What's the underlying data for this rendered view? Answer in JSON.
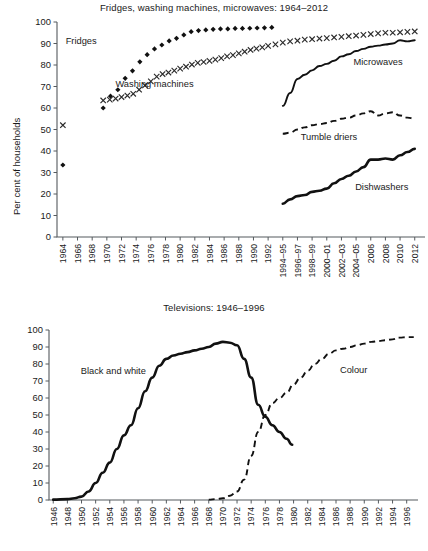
{
  "chart_data": [
    {
      "type": "line",
      "title": "Fridges, washing machines, microwaves: 1964–2012",
      "xlabel": "",
      "ylabel": "Per cent of households",
      "ylim": [
        0,
        100
      ],
      "ytick_labels": [
        "0",
        "10",
        "20",
        "30",
        "40",
        "50",
        "60",
        "70",
        "80",
        "90",
        "100"
      ],
      "grid": false,
      "legend_position": "inline-annotations",
      "categories": [
        "1964",
        "1966",
        "1968",
        "1970",
        "1972",
        "1974",
        "1976",
        "1978",
        "1980",
        "1982",
        "1984",
        "1986",
        "1988",
        "1990",
        "1992",
        "1994–95",
        "1996–97",
        "1998–99",
        "2000–01",
        "2002–03",
        "2004–05",
        "2006",
        "2008",
        "2010",
        "2012"
      ],
      "series": [
        {
          "name": "Fridges",
          "style": "diamond-markers",
          "x": [
            1964,
            1969.5,
            1970.5,
            1971.5,
            1972.5,
            1973.5,
            1974.5,
            1975.5,
            1976.5,
            1977.5,
            1978.5,
            1979.5,
            1980.5,
            1981.5,
            1982.5,
            1983.5,
            1984.5,
            1985.5,
            1986.5,
            1987.5,
            1988.5,
            1989.5,
            1990.5,
            1991.5,
            1992.5
          ],
          "values": [
            33.5,
            60,
            65.5,
            68.5,
            73.8,
            77.3,
            81.5,
            84.8,
            87.5,
            89.3,
            91.2,
            92.4,
            94,
            95.5,
            96,
            96.3,
            96.6,
            96.8,
            96.8,
            97,
            97,
            97.1,
            97.2,
            97.3,
            97.5
          ]
        },
        {
          "name": "Washing machines",
          "style": "cross-markers",
          "x": [
            1964,
            1969.5,
            1970.4,
            1971.2,
            1972,
            1972.8,
            1973.6,
            1974.4,
            1975.2,
            1976,
            1976.8,
            1977.6,
            1978.4,
            1979.2,
            1980,
            1980.8,
            1981.6,
            1982.4,
            1983.2,
            1984,
            1984.8,
            1985.6,
            1986.4,
            1987.2,
            1988,
            1988.8,
            1989.6,
            1990.4,
            1991.2,
            1992,
            1993,
            1994,
            1995,
            1996,
            1997,
            1998,
            1999,
            2000,
            2001,
            2002,
            2003,
            2004,
            2005,
            2006,
            2007,
            2008,
            2009,
            2010,
            2011,
            2012
          ],
          "values": [
            52,
            63.5,
            63.9,
            64.4,
            65.1,
            65.8,
            66.6,
            68.5,
            70.5,
            72.4,
            74.6,
            75.8,
            76.5,
            77.4,
            78.3,
            79.2,
            80.2,
            81,
            81.4,
            81.9,
            82.5,
            83.2,
            84,
            84.6,
            85.4,
            86.2,
            87,
            87.6,
            88.2,
            88.9,
            89.6,
            90.4,
            91,
            91.3,
            91.8,
            92,
            92.3,
            92.5,
            92.8,
            93.1,
            93.4,
            93.7,
            94,
            94.4,
            94.7,
            95,
            95,
            95.2,
            95.4,
            95.6
          ]
        },
        {
          "name": "Microwaves",
          "style": "solid-line",
          "x": [
            1994,
            1995,
            1996,
            1997,
            1998,
            1999,
            2000,
            2001,
            2002,
            2003,
            2004,
            2005,
            2006,
            2007,
            2008,
            2009,
            2010,
            2011,
            2012
          ],
          "values": [
            61,
            67,
            73.5,
            75.5,
            77.5,
            79.5,
            80.5,
            82,
            84,
            85,
            86.5,
            87.5,
            88.5,
            89,
            89.5,
            90,
            91.5,
            91,
            91.5
          ]
        },
        {
          "name": "Tumble driers",
          "style": "dashed-line",
          "x": [
            1994,
            1995,
            1996,
            1997,
            1998,
            1999,
            2000,
            2001,
            2002,
            2003,
            2004,
            2005,
            2006,
            2007,
            2008,
            2009,
            2010,
            2011,
            2012
          ],
          "values": [
            48,
            48.5,
            50,
            51,
            52,
            52.5,
            53,
            54,
            55,
            55.5,
            56.5,
            57.5,
            58.5,
            56.5,
            57.5,
            58,
            56.5,
            55.5,
            55
          ]
        },
        {
          "name": "Dishwashers",
          "style": "solid-line-thick",
          "x": [
            1994,
            1995,
            1996,
            1997,
            1998,
            1999,
            2000,
            2001,
            2002,
            2003,
            2004,
            2005,
            2006,
            2007,
            2008,
            2009,
            2010,
            2011,
            2012
          ],
          "values": [
            15.5,
            17.5,
            19,
            19.5,
            21,
            21.5,
            22.5,
            25,
            27,
            28.5,
            30.5,
            32.5,
            36,
            36,
            36.5,
            36,
            38,
            39.5,
            41
          ]
        }
      ],
      "annotations": [
        {
          "text": "Fridges",
          "x": 1966.5,
          "y": 90
        },
        {
          "text": "Washing machines",
          "x": 1976.5,
          "y": 70
        },
        {
          "text": "Microwaves",
          "x": 2007,
          "y": 80
        },
        {
          "text": "Tumble driers",
          "x": 2000.3,
          "y": 45
        },
        {
          "text": "Dishwashers",
          "x": 2007.5,
          "y": 22
        }
      ]
    },
    {
      "type": "line",
      "title": "Televisions: 1946–1996",
      "xlabel": "",
      "ylabel": "Per cent of households",
      "ylim": [
        0,
        100
      ],
      "ytick_labels": [
        "0",
        "10",
        "20",
        "30",
        "40",
        "50",
        "60",
        "70",
        "80",
        "90",
        "100"
      ],
      "grid": false,
      "legend_position": "inline-annotations",
      "categories": [
        "1946",
        "1948",
        "1950",
        "1952",
        "1954",
        "1956",
        "1958",
        "1960",
        "1962",
        "1964",
        "1966",
        "1968",
        "1970",
        "1972",
        "1974",
        "1976",
        "1978",
        "1980",
        "1982",
        "1984",
        "1986",
        "1988",
        "1990",
        "1992",
        "1994",
        "1996"
      ],
      "series": [
        {
          "name": "Black and white",
          "style": "solid-line-thick",
          "x": [
            1946,
            1948,
            1949,
            1950,
            1951,
            1952,
            1953,
            1954,
            1955,
            1956,
            1957,
            1958,
            1959,
            1960,
            1961,
            1962,
            1963,
            1964,
            1965,
            1966,
            1967,
            1968,
            1969,
            1970,
            1971,
            1972,
            1973,
            1974,
            1975,
            1976,
            1977,
            1978,
            1979,
            1979.8
          ],
          "values": [
            0.2,
            0.5,
            1,
            2,
            5,
            10,
            16,
            22,
            30,
            38,
            44,
            54,
            64,
            72,
            79,
            83,
            85,
            86,
            87,
            88,
            89,
            90,
            92,
            93,
            92.5,
            91,
            83,
            72,
            56,
            49,
            44,
            40,
            36,
            32.5
          ]
        },
        {
          "name": "Colour",
          "style": "dashed-line",
          "x": [
            1968,
            1969,
            1970,
            1971,
            1972,
            1973,
            1974,
            1975,
            1976,
            1977,
            1978,
            1979,
            1980,
            1981,
            1982,
            1983,
            1984,
            1985,
            1986,
            1987,
            1988,
            1989,
            1990,
            1991,
            1992,
            1993,
            1994,
            1995,
            1996,
            1997
          ],
          "values": [
            0.2,
            0.5,
            1,
            2.5,
            5,
            12,
            26,
            40,
            50,
            57,
            60,
            63,
            68,
            72,
            76,
            80,
            83,
            86,
            88,
            89,
            90,
            91,
            92,
            93,
            93.5,
            94,
            94.5,
            95.5,
            95.8,
            95.8
          ]
        }
      ],
      "annotations": [
        {
          "text": "Black and white",
          "x": 1954.5,
          "y": 74
        },
        {
          "text": "Colour",
          "x": 1988.5,
          "y": 75
        }
      ]
    }
  ]
}
